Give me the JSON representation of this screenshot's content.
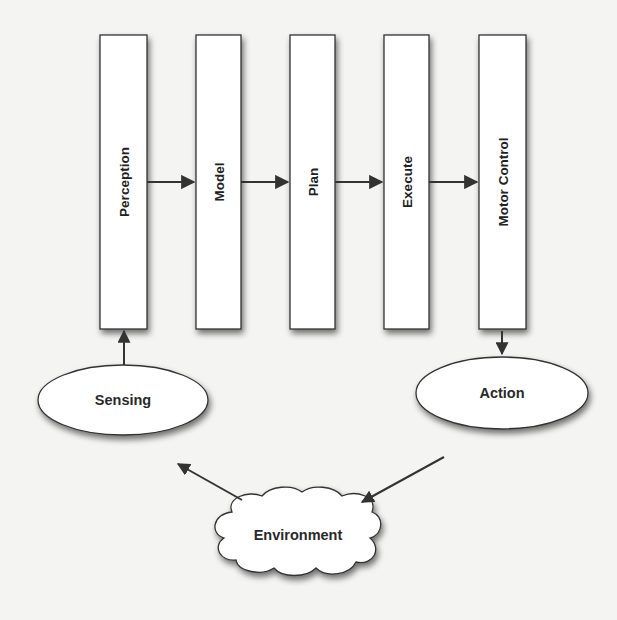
{
  "diagram": {
    "pipeline": [
      {
        "id": "perception",
        "label": "Perception"
      },
      {
        "id": "model",
        "label": "Model"
      },
      {
        "id": "plan",
        "label": "Plan"
      },
      {
        "id": "execute",
        "label": "Execute"
      },
      {
        "id": "motor_control",
        "label": "Motor Control"
      }
    ],
    "nodes": {
      "sensing": {
        "label": "Sensing",
        "shape": "ellipse"
      },
      "action": {
        "label": "Action",
        "shape": "ellipse"
      },
      "environment": {
        "label": "Environment",
        "shape": "cloud"
      }
    },
    "edges": [
      {
        "from": "perception",
        "to": "model"
      },
      {
        "from": "model",
        "to": "plan"
      },
      {
        "from": "plan",
        "to": "execute"
      },
      {
        "from": "execute",
        "to": "motor_control"
      },
      {
        "from": "motor_control",
        "to": "action"
      },
      {
        "from": "action",
        "to": "environment"
      },
      {
        "from": "environment",
        "to": "sensing"
      },
      {
        "from": "sensing",
        "to": "perception"
      }
    ],
    "colors": {
      "stroke": "#333333",
      "fill": "#ffffff",
      "background": "#f4f4f2"
    }
  }
}
